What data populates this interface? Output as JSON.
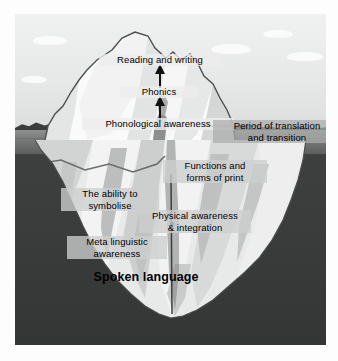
{
  "figure": {
    "colors": {
      "sky": "#e9eaea",
      "sea_surface": "#7a7c7c",
      "deep_water": "#3a3c3c",
      "ice_light": "#f4f4f4",
      "ice_mid": "#d8d9d9",
      "ice_shadow": "#b9bbbb",
      "outline": "#4a4c4c",
      "land": "#3b3c3c",
      "label_text": "#000000"
    }
  },
  "above_water": {
    "labels": [
      {
        "id": "reading",
        "text": "Reading and writing"
      },
      {
        "id": "phonics",
        "text": "Phonics"
      },
      {
        "id": "phono",
        "text": "Phonological awareness"
      }
    ],
    "arrows": [
      {
        "id": "arrow-upper",
        "from": "Phonics",
        "to": "Reading and writing",
        "direction": "up"
      },
      {
        "id": "arrow-lower",
        "from": "Phonological awareness",
        "to": "Phonics",
        "direction": "up"
      }
    ]
  },
  "waterline": {
    "label": "Period of translation and transition",
    "line1": "Period of translation",
    "line2": "and transition"
  },
  "below_water": {
    "labels": [
      {
        "id": "functions",
        "line1": "Functions and",
        "line2": "forms of print"
      },
      {
        "id": "ability",
        "line1": "The ability to",
        "line2": "symbolise"
      },
      {
        "id": "physical",
        "line1": "Physical awareness",
        "line2": "& integration"
      },
      {
        "id": "meta",
        "line1": "Meta linguistic",
        "line2": "awareness"
      }
    ],
    "foundation": "Spoken language"
  }
}
